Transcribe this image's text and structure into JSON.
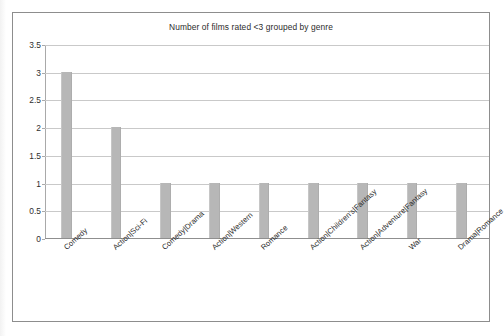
{
  "chart_data": {
    "type": "bar",
    "title": "Number of films rated <3 grouped by genre",
    "xlabel": "",
    "ylabel": "",
    "categories": [
      "Comedy",
      "Action|Sci-Fi",
      "Comedy|Drama",
      "Action|Western",
      "Romance",
      "Action|Children's|Fantasy",
      "Action|Adventure|Fantasy",
      "War",
      "Drama|Romance"
    ],
    "values": [
      3,
      2,
      1,
      1,
      1,
      1,
      1,
      1,
      1
    ],
    "ylim": [
      0,
      3.5
    ],
    "y_ticks": [
      "0",
      "0.5",
      "1",
      "1.5",
      "2",
      "2.5",
      "3",
      "3.5"
    ],
    "y_tick_values": [
      0,
      0.5,
      1,
      1.5,
      2,
      2.5,
      3,
      3.5
    ],
    "grid": true,
    "legend": false,
    "legend_position": "none",
    "bar_color": "#b7b7b7",
    "gridline_color": "#c9c9c9",
    "axis_color": "#8f8f8f",
    "background_color": "#ffffff",
    "border_color": "#8d8d8d",
    "x_tick_label_rotation": -42
  }
}
